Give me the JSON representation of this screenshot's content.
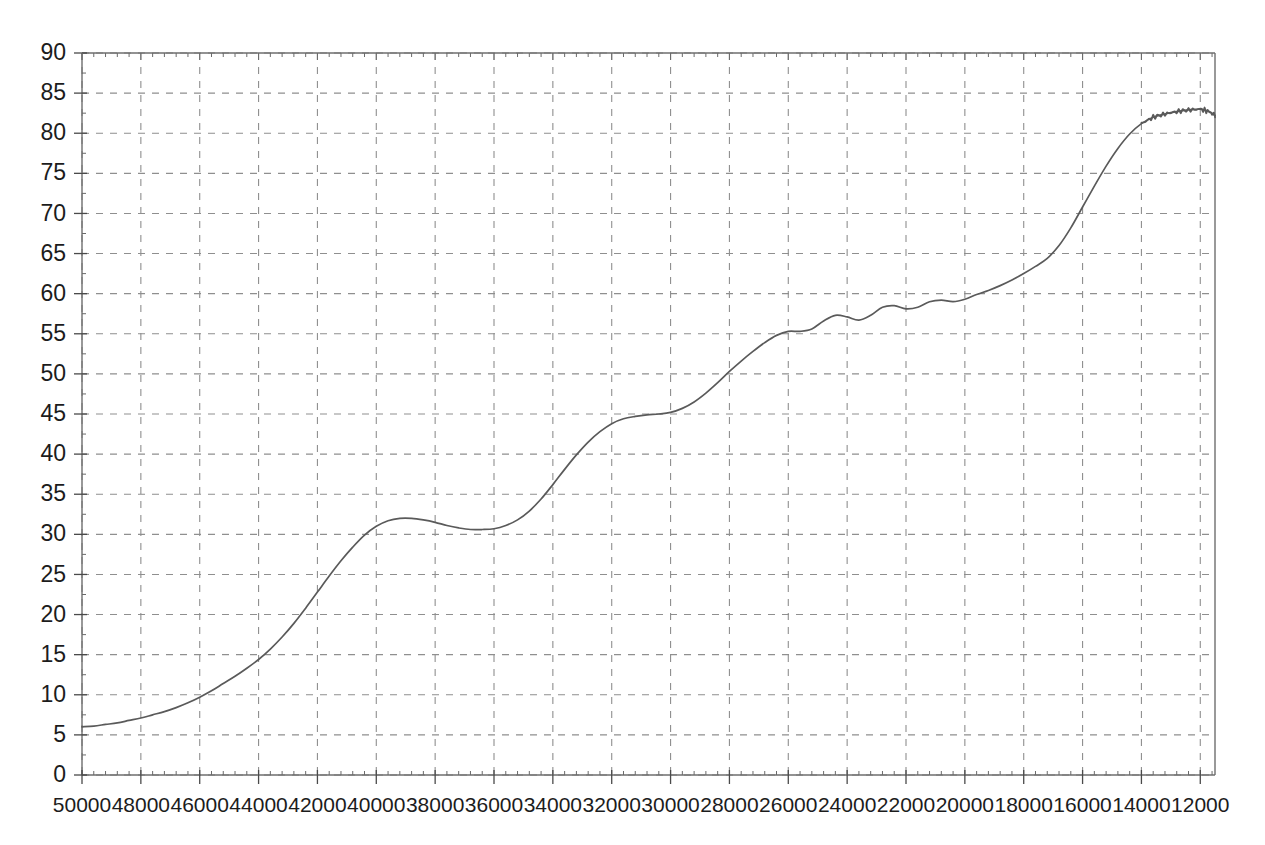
{
  "chart_data": {
    "type": "line",
    "title": "",
    "subtitle": "",
    "xlabel": "",
    "ylabel": "",
    "xlim": [
      50000,
      11500
    ],
    "ylim": [
      0,
      90
    ],
    "x_reversed": true,
    "grid": true,
    "legend": null,
    "legend_position": "none",
    "y_ticks": [
      0,
      5,
      10,
      15,
      20,
      25,
      30,
      35,
      40,
      45,
      50,
      55,
      60,
      65,
      70,
      75,
      80,
      85,
      90
    ],
    "y_tick_labels": [
      "0",
      "5",
      "10",
      "15",
      "20",
      "25",
      "30",
      "35",
      "40",
      "45",
      "50",
      "55",
      "60",
      "65",
      "70",
      "75",
      "80",
      "85",
      "90"
    ],
    "x_ticks": [
      50000,
      48000,
      46000,
      44000,
      42000,
      40000,
      38000,
      36000,
      34000,
      32000,
      30000,
      28000,
      26000,
      24000,
      22000,
      20000,
      18000,
      16000,
      14000,
      12000
    ],
    "x_tick_labels": [
      "50000",
      "48000",
      "46000",
      "44000",
      "42000",
      "40000",
      "38000",
      "36000",
      "34000",
      "32000",
      "30000",
      "28000",
      "26000",
      "24000",
      "22000",
      "20000",
      "18000",
      "16000",
      "14000",
      "12000"
    ],
    "x_minor_step": 400,
    "y_minor_step": 2.5,
    "series": [
      {
        "name": "curve",
        "color": "#5a5a5a",
        "x": [
          50000,
          49600,
          49200,
          48800,
          48400,
          48000,
          47600,
          47200,
          46800,
          46400,
          46000,
          45600,
          45200,
          44800,
          44400,
          44000,
          43600,
          43200,
          42800,
          42400,
          42000,
          41600,
          41200,
          40800,
          40400,
          40000,
          39600,
          39200,
          38800,
          38400,
          38000,
          37600,
          37200,
          36800,
          36400,
          36000,
          35600,
          35200,
          34800,
          34400,
          34000,
          33600,
          33200,
          32800,
          32400,
          32000,
          31600,
          31200,
          30800,
          30400,
          30000,
          29600,
          29200,
          28800,
          28400,
          28000,
          27600,
          27200,
          26800,
          26400,
          26000,
          25600,
          25200,
          24800,
          24400,
          24000,
          23600,
          23200,
          22800,
          22400,
          22000,
          21600,
          21200,
          20800,
          20400,
          20000,
          19600,
          19200,
          18800,
          18400,
          18000,
          17600,
          17200,
          16800,
          16400,
          16000,
          15600,
          15200,
          14800,
          14400,
          14000,
          13600,
          13200,
          12800,
          12400,
          12000,
          11700,
          11500
        ],
        "y": [
          6.0,
          6.1,
          6.3,
          6.5,
          6.8,
          7.1,
          7.5,
          7.9,
          8.4,
          9.0,
          9.7,
          10.5,
          11.4,
          12.3,
          13.3,
          14.4,
          15.7,
          17.2,
          18.9,
          20.8,
          22.8,
          24.8,
          26.7,
          28.4,
          29.9,
          31.0,
          31.7,
          32.0,
          32.0,
          31.8,
          31.5,
          31.1,
          30.8,
          30.6,
          30.6,
          30.7,
          31.1,
          31.8,
          32.9,
          34.4,
          36.2,
          38.1,
          39.9,
          41.5,
          42.8,
          43.8,
          44.4,
          44.7,
          44.9,
          45.0,
          45.2,
          45.7,
          46.5,
          47.6,
          48.9,
          50.3,
          51.6,
          52.8,
          53.9,
          54.8,
          55.3,
          55.3,
          55.6,
          56.6,
          57.3,
          57.1,
          56.7,
          57.3,
          58.3,
          58.5,
          58.1,
          58.3,
          59.0,
          59.2,
          59.0,
          59.3,
          59.9,
          60.4,
          61.0,
          61.7,
          62.5,
          63.4,
          64.4,
          66.0,
          68.2,
          70.8,
          73.4,
          75.9,
          78.1,
          79.9,
          81.2,
          82.0,
          82.4,
          82.7,
          82.9,
          83.0,
          82.7,
          82.2
        ]
      }
    ],
    "annotations": []
  },
  "axes": {
    "plot_left_px": 82,
    "plot_right_px": 1215,
    "plot_top_px": 53,
    "plot_bottom_px": 775
  }
}
